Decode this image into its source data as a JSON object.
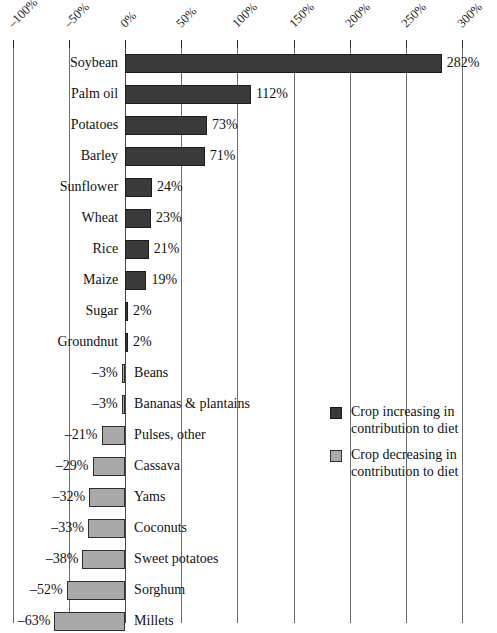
{
  "chart_data": {
    "type": "bar",
    "orientation": "horizontal",
    "title": "",
    "subtitle": "",
    "xlabel": "",
    "ylabel": "",
    "xlim": [
      -100,
      300
    ],
    "xticks": [
      -100,
      -50,
      0,
      50,
      100,
      150,
      200,
      250,
      300
    ],
    "xtick_labels": [
      "–100%",
      "–50%",
      "0%",
      "50%",
      "100%",
      "150%",
      "200%",
      "250%",
      "300%"
    ],
    "grid": "vertical",
    "categories": [
      "Soybean",
      "Palm oil",
      "Potatoes",
      "Barley",
      "Sunflower",
      "Wheat",
      "Rice",
      "Maize",
      "Sugar",
      "Groundnut",
      "Beans",
      "Bananas & plantains",
      "Pulses, other",
      "Cassava",
      "Yams",
      "Coconuts",
      "Sweet potatoes",
      "Sorghum",
      "Millets"
    ],
    "values": [
      282,
      112,
      73,
      71,
      24,
      23,
      21,
      19,
      2,
      2,
      -3,
      -3,
      -21,
      -29,
      -32,
      -33,
      -38,
      -52,
      -63
    ],
    "value_labels": [
      "282%",
      "112%",
      "73%",
      "71%",
      "24%",
      "23%",
      "21%",
      "19%",
      "2%",
      "2%",
      "–3%",
      "–3%",
      "–21%",
      "–29%",
      "–32%",
      "–33%",
      "–38%",
      "–52%",
      "–63%"
    ],
    "series": [
      {
        "name": "Crop increasing in contribution to diet",
        "color": "#3a3a3a",
        "values": [
          282,
          112,
          73,
          71,
          24,
          23,
          21,
          19,
          2,
          2,
          null,
          null,
          null,
          null,
          null,
          null,
          null,
          null,
          null
        ]
      },
      {
        "name": "Crop decreasing in contribution to diet",
        "color": "#a9a9a9",
        "values": [
          null,
          null,
          null,
          null,
          null,
          null,
          null,
          null,
          null,
          null,
          -3,
          -3,
          -21,
          -29,
          -32,
          -33,
          -38,
          -52,
          -63
        ]
      }
    ],
    "legend": {
      "position": "right-middle",
      "entries": [
        {
          "label": "Crop increasing in contribution to diet",
          "color": "#3a3a3a"
        },
        {
          "label": "Crop decreasing in contribution to diet",
          "color": "#a9a9a9"
        }
      ]
    }
  },
  "colors": {
    "positive_fill": "#3a3a3a",
    "positive_stroke": "#1b1b1b",
    "negative_fill": "#a9a9a9",
    "negative_stroke": "#2e2e2e",
    "gridline": "#6f6f6f",
    "text": "#121212",
    "background": "#ffffff"
  }
}
